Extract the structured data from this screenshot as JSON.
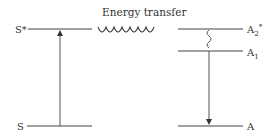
{
  "diagram": {
    "title": "Energy transfer",
    "donor": {
      "excited_label": "S*",
      "ground_label": "S"
    },
    "acceptor": {
      "excited2_label_base": "A",
      "excited2_label_sub": "2",
      "excited2_label_sup": "*",
      "excited1_label_base": "A",
      "excited1_label_sub": "1",
      "ground_label": "A"
    },
    "colors": {
      "line": "#444444",
      "text": "#333333"
    }
  }
}
